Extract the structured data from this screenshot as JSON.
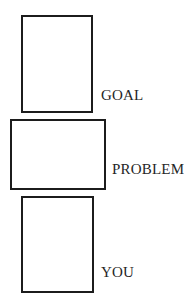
{
  "diagram": {
    "background_color": "#ffffff",
    "stroke_color": "#1c1c1c",
    "text_color": "#262626",
    "nodes": [
      {
        "id": "goal",
        "label": "GOAL",
        "shape": "rectangle",
        "fill": "#ffffff",
        "x": 21,
        "y": 15,
        "width": 72,
        "height": 98,
        "label_x": 101,
        "label_y": 88
      },
      {
        "id": "problem",
        "label": "PROBLEM",
        "shape": "rectangle",
        "fill": "#ffffff",
        "x": 10,
        "y": 119,
        "width": 96,
        "height": 71,
        "label_x": 112,
        "label_y": 162
      },
      {
        "id": "you",
        "label": "YOU",
        "shape": "rectangle",
        "fill": "#ffffff",
        "x": 21,
        "y": 196,
        "width": 73,
        "height": 97,
        "label_x": 101,
        "label_y": 265
      }
    ]
  }
}
